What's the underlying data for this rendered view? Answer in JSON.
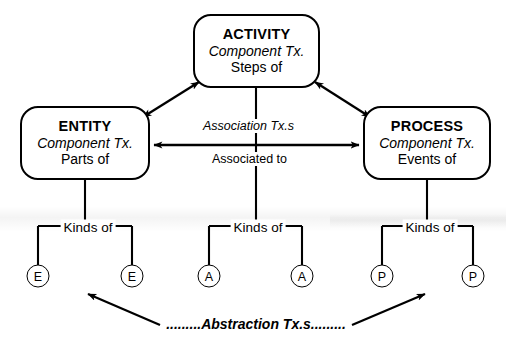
{
  "diagram": {
    "nodes": [
      {
        "id": "entity",
        "title": "ENTITY",
        "subtitle": "Component Tx.",
        "relation": "Parts of"
      },
      {
        "id": "activity",
        "title": "ACTIVITY",
        "subtitle": "Component Tx.",
        "relation": "Steps of"
      },
      {
        "id": "process",
        "title": "PROCESS",
        "subtitle": "Component Tx.",
        "relation": "Events of"
      }
    ],
    "edge_labels": {
      "association_tx": "Association Tx.s",
      "associated_to": "Associated to",
      "abstraction_tx": ".........Abstraction Tx.s........."
    },
    "branches": [
      {
        "id": "entity-branch",
        "label": "Kinds of",
        "leaves": [
          "E",
          "E"
        ]
      },
      {
        "id": "activity-branch",
        "label": "Kinds of",
        "leaves": [
          "A",
          "A"
        ]
      },
      {
        "id": "process-branch",
        "label": "Kinds of",
        "leaves": [
          "P",
          "P"
        ]
      }
    ],
    "colors": {
      "stroke": "#000000",
      "background": "#ffffff"
    }
  }
}
